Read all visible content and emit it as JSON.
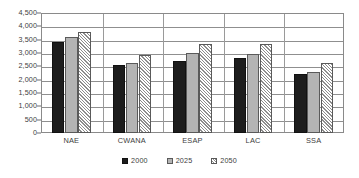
{
  "chart_data": {
    "type": "bar",
    "title": "",
    "subtitle": "",
    "xlabel": "",
    "ylabel": "",
    "categories": [
      "NAE",
      "CWANA",
      "ESAP",
      "LAC",
      "SSA"
    ],
    "series": [
      {
        "name": "2000",
        "color": "#1d1d1d",
        "pattern": "solid-black",
        "values": [
          3400,
          2560,
          2690,
          2810,
          2230
        ]
      },
      {
        "name": "2025",
        "color": "#b4b4b4",
        "pattern": "solid-gray",
        "values": [
          3600,
          2630,
          3000,
          2960,
          2280
        ]
      },
      {
        "name": "2050",
        "color": "#ffffff",
        "pattern": "diagonal-hatch",
        "values": [
          3800,
          2930,
          3330,
          3330,
          2640
        ]
      }
    ],
    "ylim": [
      0,
      4500
    ],
    "y_ticks": [
      0,
      500,
      1000,
      1500,
      2000,
      2500,
      3000,
      3500,
      4000,
      4500
    ],
    "y_tick_labels": [
      "0",
      "500",
      "1,000",
      "1,500",
      "2,000",
      "2,500",
      "3,000",
      "3,500",
      "4,000",
      "4,500"
    ],
    "grid": true,
    "grid_axis": "y",
    "legend_position": "bottom-center",
    "legend_entries": [
      "2000",
      "2025",
      "2050"
    ],
    "annotations": []
  }
}
